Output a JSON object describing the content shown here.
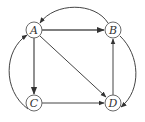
{
  "diagram": {
    "type": "directed-graph",
    "nodes": [
      {
        "id": "A",
        "label": "A",
        "x": 34,
        "y": 30
      },
      {
        "id": "B",
        "label": "B",
        "x": 113,
        "y": 30
      },
      {
        "id": "C",
        "label": "C",
        "x": 34,
        "y": 103
      },
      {
        "id": "D",
        "label": "D",
        "x": 113,
        "y": 103
      }
    ],
    "edges": [
      {
        "from": "A",
        "to": "B",
        "shape": "straight"
      },
      {
        "from": "A",
        "to": "C",
        "shape": "straight"
      },
      {
        "from": "A",
        "to": "D",
        "shape": "straight"
      },
      {
        "from": "C",
        "to": "D",
        "shape": "straight"
      },
      {
        "from": "D",
        "to": "B",
        "shape": "straight"
      },
      {
        "from": "B",
        "to": "A",
        "shape": "curved-top"
      },
      {
        "from": "C",
        "to": "A",
        "shape": "curved-left"
      },
      {
        "from": "B",
        "to": "D",
        "shape": "curved-right"
      }
    ],
    "colors": {
      "node_stroke": "#6a6a6a",
      "edge": "#444444",
      "background": "#ffffff"
    }
  }
}
